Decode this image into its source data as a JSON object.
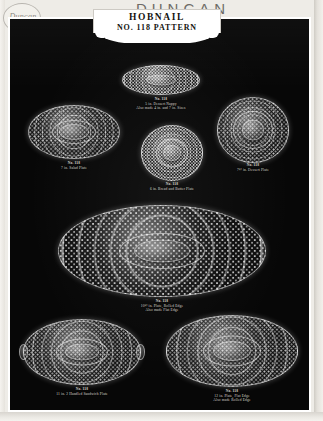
{
  "page": {
    "brand": "DUNCAN",
    "logo_script": "Duncan",
    "banner_title": "HOBNAIL",
    "banner_subtitle": "NO. 118 PATTERN"
  },
  "items": [
    {
      "id": "dessert-nappy",
      "number": "No. 118",
      "name": "5 in. Dessert Nappy",
      "note": "Also made 4 in. and 7 in. Sizes"
    },
    {
      "id": "salad-plate",
      "number": "No. 118",
      "name": "7 in. Salad Plate",
      "note": ""
    },
    {
      "id": "dessert-plate",
      "number": "No. 118",
      "name": "7½ in. Dessert Plate",
      "note": ""
    },
    {
      "id": "bread-butter-plate",
      "number": "No. 118",
      "name": "6 in. Bread and Butter Plate",
      "note": ""
    },
    {
      "id": "rolled-edge-plate",
      "number": "No. 118",
      "name": "10½ in. Plate, Rolled Edge",
      "note": "Also made Flat Edge"
    },
    {
      "id": "sandwich-plate",
      "number": "No. 118",
      "name": "11 in. 2 Handled Sandwich Plate",
      "note": ""
    },
    {
      "id": "flat-edge-plate",
      "number": "No. 118",
      "name": "12 in. Plate, Flat Edge",
      "note": "Also made Rolled Edge"
    }
  ]
}
